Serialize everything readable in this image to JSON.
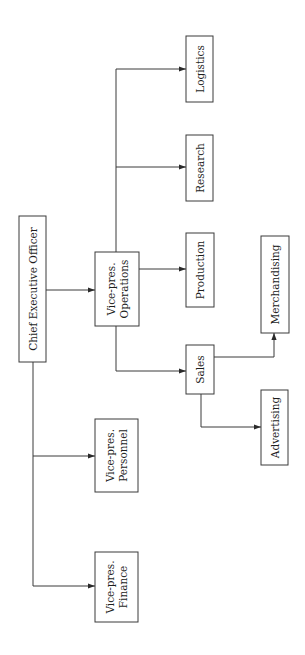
{
  "diagram": {
    "type": "org-chart",
    "orientation": "rotated-90-ccw",
    "nodes": [
      {
        "id": "ceo",
        "lines": [
          "Chief Executive Officer"
        ]
      },
      {
        "id": "vp-operations",
        "lines": [
          "Vice-pres.",
          "Operations"
        ]
      },
      {
        "id": "vp-personnel",
        "lines": [
          "Vice-pres.",
          "Personnel"
        ]
      },
      {
        "id": "vp-finance",
        "lines": [
          "Vice-pres.",
          "Finance"
        ]
      },
      {
        "id": "logistics",
        "lines": [
          "Logistics"
        ]
      },
      {
        "id": "research",
        "lines": [
          "Research"
        ]
      },
      {
        "id": "production",
        "lines": [
          "Production"
        ]
      },
      {
        "id": "sales",
        "lines": [
          "Sales"
        ]
      },
      {
        "id": "merchandising",
        "lines": [
          "Merchandising"
        ]
      },
      {
        "id": "advertising",
        "lines": [
          "Advertising"
        ]
      }
    ],
    "edges": [
      {
        "from": "ceo",
        "to": "vp-operations"
      },
      {
        "from": "ceo",
        "to": "vp-personnel"
      },
      {
        "from": "ceo",
        "to": "vp-finance"
      },
      {
        "from": "vp-operations",
        "to": "logistics"
      },
      {
        "from": "vp-operations",
        "to": "research"
      },
      {
        "from": "vp-operations",
        "to": "production"
      },
      {
        "from": "vp-operations",
        "to": "sales"
      },
      {
        "from": "sales",
        "to": "merchandising"
      },
      {
        "from": "sales",
        "to": "advertising"
      }
    ],
    "colors": {
      "line": "#3a3a3a",
      "text": "#1e1e1e",
      "background": "#ffffff"
    }
  }
}
